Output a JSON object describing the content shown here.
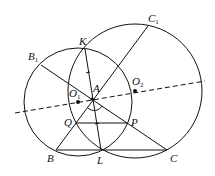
{
  "diagram": {
    "type": "geometry-construction",
    "stroke_color": "#111111",
    "background": "#ffffff",
    "circles": [
      {
        "name": "circle-O1",
        "center": "O1",
        "cx": 78,
        "cy": 102,
        "r": 54
      },
      {
        "name": "circle-O2",
        "center": "O2",
        "cx": 135,
        "cy": 91,
        "r": 67
      }
    ],
    "points": {
      "A": {
        "label": "A",
        "x": 92,
        "y": 99
      },
      "K": {
        "label": "K",
        "x": 85,
        "y": 49
      },
      "L": {
        "label": "L",
        "x": 101,
        "y": 150
      },
      "B": {
        "label": "B",
        "x": 56,
        "y": 150
      },
      "C": {
        "label": "C",
        "x": 167,
        "y": 150
      },
      "B1": {
        "label": "B",
        "sub": "1",
        "x": 41,
        "y": 65
      },
      "C1": {
        "label": "C",
        "sub": "1",
        "x": 148,
        "y": 26
      },
      "Q": {
        "label": "Q",
        "x": 77,
        "y": 123
      },
      "P": {
        "label": "P",
        "x": 128,
        "y": 123
      },
      "O1": {
        "label": "O",
        "sub": "1",
        "x": 78,
        "y": 102
      },
      "O2": {
        "label": "O",
        "sub": "2",
        "x": 135,
        "y": 91
      }
    },
    "segments": [
      [
        "K",
        "L"
      ],
      [
        "B",
        "C"
      ],
      [
        "B",
        "C1"
      ],
      [
        "B1",
        "C"
      ],
      [
        "Q",
        "P"
      ]
    ],
    "dashed_line": {
      "x1": 15,
      "y1": 113,
      "x2": 205,
      "y2": 81
    },
    "angle_mark": {
      "vertex": "A",
      "between": [
        "L",
        "C"
      ]
    }
  }
}
